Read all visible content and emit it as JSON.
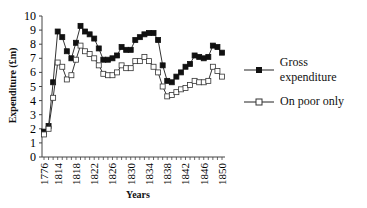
{
  "chart_data": {
    "type": "line",
    "title": "",
    "xlabel": "Years",
    "ylabel": "Expenditure (£m)",
    "ylim": [
      0,
      10
    ],
    "yticks": [
      0,
      1,
      2,
      3,
      4,
      5,
      6,
      7,
      8,
      9,
      10
    ],
    "xtick_labels": [
      "1776",
      "1814",
      "1818",
      "1822",
      "1826",
      "1830",
      "1834",
      "1838",
      "1842",
      "1846",
      "1850"
    ],
    "categories": [
      "1776",
      "1803",
      "1813",
      "1814",
      "1815",
      "1816",
      "1817",
      "1818",
      "1819",
      "1820",
      "1821",
      "1822",
      "1823",
      "1824",
      "1825",
      "1826",
      "1827",
      "1828",
      "1829",
      "1830",
      "1831",
      "1832",
      "1833",
      "1834",
      "1835",
      "1836",
      "1837",
      "1838",
      "1839",
      "1840",
      "1841",
      "1842",
      "1843",
      "1844",
      "1845",
      "1846",
      "1847",
      "1848",
      "1849",
      "1850"
    ],
    "series": [
      {
        "name": "Gross expenditure",
        "marker": "filled-square",
        "values": [
          1.8,
          2.2,
          5.3,
          8.9,
          8.5,
          7.5,
          7.0,
          8.1,
          9.3,
          8.9,
          8.7,
          8.4,
          7.7,
          6.9,
          6.9,
          7.0,
          7.2,
          7.8,
          7.6,
          7.6,
          8.3,
          8.5,
          8.7,
          8.8,
          8.8,
          8.3,
          6.5,
          5.4,
          5.3,
          5.7,
          6.0,
          6.4,
          6.6,
          7.2,
          7.1,
          7.0,
          7.1,
          7.9,
          7.8,
          7.4
        ]
      },
      {
        "name": "On poor only",
        "marker": "open-square",
        "values": [
          1.6,
          2.0,
          4.2,
          6.7,
          6.4,
          5.5,
          5.8,
          6.9,
          7.9,
          7.5,
          7.3,
          7.0,
          6.5,
          5.9,
          5.8,
          5.8,
          6.0,
          6.5,
          6.3,
          6.3,
          6.8,
          6.8,
          7.1,
          6.8,
          6.4,
          6.0,
          5.0,
          4.3,
          4.4,
          4.6,
          4.8,
          4.9,
          5.1,
          5.4,
          5.3,
          5.3,
          5.4,
          6.4,
          6.1,
          5.7
        ]
      }
    ],
    "legend": {
      "position": "right",
      "entries": [
        "Gross expenditure",
        "On poor only"
      ]
    },
    "grid": false
  },
  "legend": {
    "gross": "Gross expenditure",
    "poor": "On poor only"
  },
  "axes": {
    "xlabel": "Years",
    "ylabel": "Expenditure (£m)"
  }
}
